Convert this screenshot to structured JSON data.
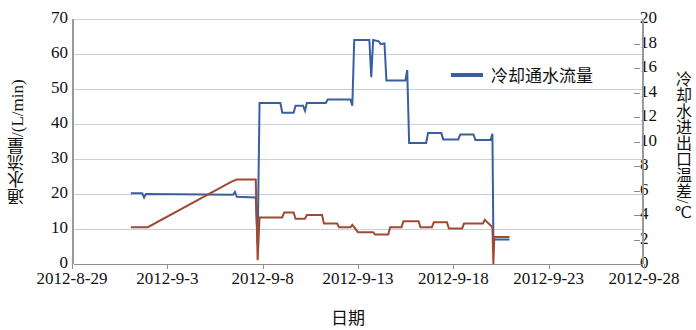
{
  "chart_data": {
    "type": "line",
    "title": "",
    "xlabel": "日期",
    "ylabel": "通水流量/(L/min)",
    "y2label": "冷却水进出口温差/℃",
    "xlim": [
      "2012-8-29",
      "2012-9-28"
    ],
    "ylim": [
      0,
      70
    ],
    "y2lim": [
      0,
      20
    ],
    "ytick_step": 10,
    "y2tick_step": 2,
    "grid": true,
    "legend_position": "inside-right-top",
    "xticks": [
      "2012-8-29",
      "2012-9-3",
      "2012-9-8",
      "2012-9-13",
      "2012-9-18",
      "2012-9-23",
      "2012-9-28"
    ],
    "yticks": [
      "0",
      "10",
      "20",
      "30",
      "40",
      "50",
      "60",
      "70"
    ],
    "y2ticks": [
      "0",
      "2",
      "4",
      "6",
      "8",
      "10",
      "12",
      "14",
      "16",
      "18",
      "20"
    ],
    "series": [
      {
        "name": "冷却通水流量",
        "axis": "left",
        "color": "#3a5fa0",
        "unit": "L/min",
        "points": [
          {
            "x": "2012-9-1.0",
            "y": 20.2
          },
          {
            "x": "2012-9-1.6",
            "y": 20.2
          },
          {
            "x": "2012-9-1.7",
            "y": 19.0
          },
          {
            "x": "2012-9-1.8",
            "y": 20.0
          },
          {
            "x": "2012-9-6.4",
            "y": 19.8
          },
          {
            "x": "2012-9-6.5",
            "y": 20.6
          },
          {
            "x": "2012-9-6.6",
            "y": 19.2
          },
          {
            "x": "2012-9-7.6",
            "y": 19.0
          },
          {
            "x": "2012-9-7.7",
            "y": 5.6
          },
          {
            "x": "2012-9-7.8",
            "y": 46.0
          },
          {
            "x": "2012-9-8.9",
            "y": 46.0
          },
          {
            "x": "2012-9-9.0",
            "y": 43.2
          },
          {
            "x": "2012-9-9.6",
            "y": 43.2
          },
          {
            "x": "2012-9-9.7",
            "y": 45.2
          },
          {
            "x": "2012-9-10.1",
            "y": 45.2
          },
          {
            "x": "2012-9-10.2",
            "y": 43.8
          },
          {
            "x": "2012-9-10.3",
            "y": 46.0
          },
          {
            "x": "2012-9-11.3",
            "y": 46.0
          },
          {
            "x": "2012-9-11.4",
            "y": 47.0
          },
          {
            "x": "2012-9-12.6",
            "y": 47.0
          },
          {
            "x": "2012-9-12.7",
            "y": 45.2
          },
          {
            "x": "2012-9-12.8",
            "y": 64.0
          },
          {
            "x": "2012-9-13.6",
            "y": 64.0
          },
          {
            "x": "2012-9-13.7",
            "y": 53.4
          },
          {
            "x": "2012-9-13.8",
            "y": 64.0
          },
          {
            "x": "2012-9-14.1",
            "y": 63.6
          },
          {
            "x": "2012-9-14.2",
            "y": 62.8
          },
          {
            "x": "2012-9-14.4",
            "y": 63.0
          },
          {
            "x": "2012-9-14.5",
            "y": 52.4
          },
          {
            "x": "2012-9-15.5",
            "y": 52.4
          },
          {
            "x": "2012-9-15.6",
            "y": 55.4
          },
          {
            "x": "2012-9-15.7",
            "y": 34.6
          },
          {
            "x": "2012-9-16.6",
            "y": 34.6
          },
          {
            "x": "2012-9-16.7",
            "y": 37.4
          },
          {
            "x": "2012-9-17.4",
            "y": 37.4
          },
          {
            "x": "2012-9-17.5",
            "y": 35.6
          },
          {
            "x": "2012-9-18.3",
            "y": 35.6
          },
          {
            "x": "2012-9-18.4",
            "y": 37.0
          },
          {
            "x": "2012-9-19.1",
            "y": 37.0
          },
          {
            "x": "2012-9-19.2",
            "y": 35.4
          },
          {
            "x": "2012-9-20.0",
            "y": 35.4
          },
          {
            "x": "2012-9-20.1",
            "y": 37.2
          },
          {
            "x": "2012-9-20.15",
            "y": 7.0
          },
          {
            "x": "2012-9-21.0",
            "y": 7.0
          }
        ]
      },
      {
        "name": "冷却水进出口温差",
        "axis": "right",
        "color": "#9e4a34",
        "unit": "℃",
        "points": [
          {
            "x": "2012-9-1.0",
            "y": 3.0
          },
          {
            "x": "2012-9-1.9",
            "y": 3.0
          },
          {
            "x": "2012-9-6.3",
            "y": 6.7
          },
          {
            "x": "2012-9-6.6",
            "y": 6.9
          },
          {
            "x": "2012-9-7.6",
            "y": 6.9
          },
          {
            "x": "2012-9-7.7",
            "y": 0.3
          },
          {
            "x": "2012-9-7.8",
            "y": 3.8
          },
          {
            "x": "2012-9-9.0",
            "y": 3.8
          },
          {
            "x": "2012-9-9.1",
            "y": 4.2
          },
          {
            "x": "2012-9-9.6",
            "y": 4.2
          },
          {
            "x": "2012-9-9.7",
            "y": 3.7
          },
          {
            "x": "2012-9-10.2",
            "y": 3.7
          },
          {
            "x": "2012-9-10.3",
            "y": 4.0
          },
          {
            "x": "2012-9-11.1",
            "y": 4.0
          },
          {
            "x": "2012-9-11.2",
            "y": 3.3
          },
          {
            "x": "2012-9-11.9",
            "y": 3.3
          },
          {
            "x": "2012-9-12.0",
            "y": 3.0
          },
          {
            "x": "2012-9-12.6",
            "y": 3.0
          },
          {
            "x": "2012-9-12.7",
            "y": 3.2
          },
          {
            "x": "2012-9-13.0",
            "y": 2.6
          },
          {
            "x": "2012-9-13.8",
            "y": 2.6
          },
          {
            "x": "2012-9-13.9",
            "y": 2.4
          },
          {
            "x": "2012-9-14.6",
            "y": 2.4
          },
          {
            "x": "2012-9-14.7",
            "y": 3.0
          },
          {
            "x": "2012-9-15.3",
            "y": 3.0
          },
          {
            "x": "2012-9-15.4",
            "y": 3.5
          },
          {
            "x": "2012-9-16.2",
            "y": 3.5
          },
          {
            "x": "2012-9-16.3",
            "y": 3.0
          },
          {
            "x": "2012-9-16.9",
            "y": 3.0
          },
          {
            "x": "2012-9-17.0",
            "y": 3.4
          },
          {
            "x": "2012-9-17.7",
            "y": 3.4
          },
          {
            "x": "2012-9-17.8",
            "y": 2.9
          },
          {
            "x": "2012-9-18.5",
            "y": 2.9
          },
          {
            "x": "2012-9-18.6",
            "y": 3.3
          },
          {
            "x": "2012-9-19.6",
            "y": 3.3
          },
          {
            "x": "2012-9-19.7",
            "y": 3.6
          },
          {
            "x": "2012-9-20.1",
            "y": 3.0
          },
          {
            "x": "2012-9-20.15",
            "y": 0.0
          },
          {
            "x": "2012-9-20.2",
            "y": 2.2
          },
          {
            "x": "2012-9-21.0",
            "y": 2.2
          }
        ]
      }
    ]
  },
  "legend": {
    "entries": [
      {
        "label": "冷却通水流量",
        "color": "#3a5fa0"
      }
    ]
  },
  "axes": {
    "left": {
      "title": "通水流量/(L/min)",
      "ticks": [
        "70",
        "60",
        "50",
        "40",
        "30",
        "20",
        "10",
        "0"
      ]
    },
    "right": {
      "title": "冷却水进出口温差/℃",
      "ticks": [
        "20",
        "18",
        "16",
        "14",
        "12",
        "10",
        "8",
        "6",
        "4",
        "2",
        "0"
      ]
    },
    "bottom": {
      "title": "日期",
      "ticks": [
        "2012-8-29",
        "2012-9-3",
        "2012-9-8",
        "2012-9-13",
        "2012-9-18",
        "2012-9-23",
        "2012-9-28"
      ]
    }
  }
}
